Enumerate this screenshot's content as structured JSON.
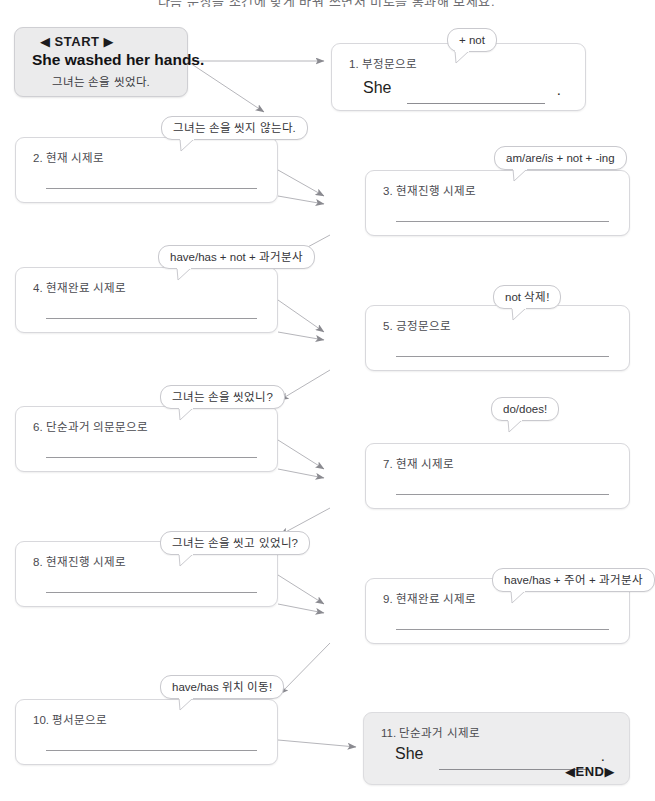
{
  "page": {
    "title_strip": "다음 문장을 조건에 맞게 바꿔 쓰면서 미로를 통과해 보세요.",
    "accent_line": "#9a9a9e",
    "box_border": "#d8d8dc",
    "shade_fill": "#ededee"
  },
  "start": {
    "marker": "◀ START ▶",
    "sentence_en": "She washed her hands.",
    "sentence_ko": "그녀는 손을 씻었다."
  },
  "end": {
    "marker": "◀END▶"
  },
  "nodes": [
    {
      "id": 1,
      "label": "1. 부정문으로",
      "subject": "She",
      "period": ".",
      "has_prompt": true,
      "shaded": false
    },
    {
      "id": 2,
      "label": "2. 현재 시제로",
      "has_prompt": false,
      "shaded": false
    },
    {
      "id": 3,
      "label": "3. 현재진행 시제로",
      "has_prompt": false,
      "shaded": false
    },
    {
      "id": 4,
      "label": "4. 현재완료 시제로",
      "has_prompt": false,
      "shaded": false
    },
    {
      "id": 5,
      "label": "5. 긍정문으로",
      "has_prompt": false,
      "shaded": false
    },
    {
      "id": 6,
      "label": "6. 단순과거 의문문으로",
      "has_prompt": false,
      "shaded": false
    },
    {
      "id": 7,
      "label": "7. 현재 시제로",
      "has_prompt": false,
      "shaded": false
    },
    {
      "id": 8,
      "label": "8. 현재진행 시제로",
      "has_prompt": false,
      "shaded": false
    },
    {
      "id": 9,
      "label": "9. 현재완료 시제로",
      "has_prompt": false,
      "shaded": false
    },
    {
      "id": 10,
      "label": "10. 평서문으로",
      "has_prompt": false,
      "shaded": false
    },
    {
      "id": 11,
      "label": "11. 단순과거 시제로",
      "subject": "She",
      "period": ".",
      "has_prompt": true,
      "shaded": true
    }
  ],
  "callouts": [
    {
      "id": "c1",
      "text": "+ not",
      "for_node": 1
    },
    {
      "id": "c2",
      "text": "그녀는 손을 씻지 않는다.",
      "for_node": 2
    },
    {
      "id": "c3",
      "text": "am/are/is + not + -ing",
      "for_node": 3
    },
    {
      "id": "c4",
      "text": "have/has + not + 과거분사",
      "for_node": 4
    },
    {
      "id": "c5",
      "text": "not 삭제!",
      "for_node": 5
    },
    {
      "id": "c6",
      "text": "그녀는 손을 씻었니?",
      "for_node": 6
    },
    {
      "id": "c7",
      "text": "do/does!",
      "for_node": 7
    },
    {
      "id": "c8",
      "text": "그녀는 손을 씻고 있었니?",
      "for_node": 8
    },
    {
      "id": "c9",
      "text": "have/has + 주어 + 과거분사",
      "for_node": 9
    },
    {
      "id": "c10",
      "text": "have/has 위치 이동!",
      "for_node": 10
    }
  ]
}
